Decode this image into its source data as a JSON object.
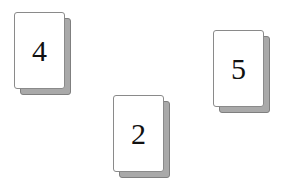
{
  "cards": [
    {
      "value": "4",
      "left": 14,
      "top": 12
    },
    {
      "value": "2",
      "left": 113,
      "top": 95
    },
    {
      "value": "5",
      "left": 213,
      "top": 30
    }
  ],
  "colors": {
    "card_face": "#ffffff",
    "card_shadow": "#a9a9a9",
    "card_border": "#8a8a8a",
    "text": "#111111"
  }
}
